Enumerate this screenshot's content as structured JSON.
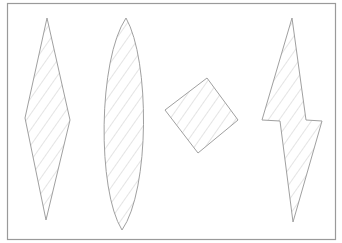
{
  "diagram": {
    "colors": {
      "background": "#ffffff",
      "frame": "#9a9a9a",
      "outline": "#a0a0a0",
      "hatch": "#d2d2d2"
    },
    "shapes": [
      {
        "id": "diamond",
        "label": "Elongated rhombus"
      },
      {
        "id": "lens",
        "label": "Elongated lens / vesica"
      },
      {
        "id": "square",
        "label": "Tilted square"
      },
      {
        "id": "bolt",
        "label": "Lightning-bolt polygon"
      }
    ]
  }
}
